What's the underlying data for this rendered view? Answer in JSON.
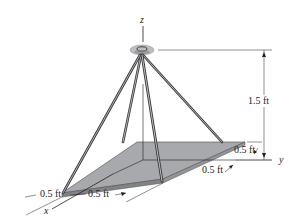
{
  "diagram": {
    "type": "statics-figure",
    "axes": {
      "z": "z",
      "y": "y",
      "x": "x"
    },
    "dimensions": {
      "height": "1.5 ft",
      "y_offset_top": "0.5 ft",
      "y_offset_bottom": "0.5 ft",
      "x_left": "0.5 ft",
      "x_right": "0.5 ft"
    },
    "colors": {
      "plate_fill": "#a7a9ac",
      "plate_edge": "#6d6e71",
      "cable": "#3a3a3a",
      "ring": "#bcbec0",
      "line": "#231f20"
    }
  }
}
